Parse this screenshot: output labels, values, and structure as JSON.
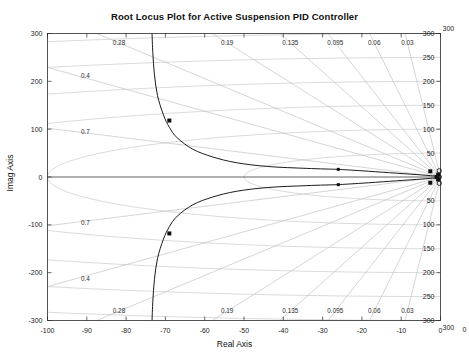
{
  "figure": {
    "title": "Root Locus Plot for Active Suspension PID Controller",
    "xlabel": "Real Axis",
    "ylabel": "Imag Axis",
    "top_artifact": "clipped text row"
  },
  "chart_data": {
    "type": "line",
    "title": "Root Locus Plot for Active Suspension PID Controller",
    "xlabel": "Real Axis",
    "ylabel": "Imag Axis",
    "xlim": [
      -100,
      0
    ],
    "ylim": [
      -300,
      300
    ],
    "grid": true,
    "legend": "none",
    "xticks": [
      -100,
      -90,
      -80,
      -70,
      -60,
      -50,
      -40,
      -30,
      -20,
      -10,
      0
    ],
    "xticklabels": [
      "-100",
      "-90",
      "-80",
      "-70",
      "-60",
      "-50",
      "-40",
      "-30",
      "-20",
      "-10",
      "0"
    ],
    "yticks": [
      -300,
      -200,
      -100,
      0,
      100,
      200,
      300
    ],
    "yticklabels": [
      "-300",
      "-200",
      "-100",
      "0",
      "100",
      "200",
      "300"
    ],
    "damping_labels_top": [
      "0.28",
      "0.19",
      "0.135",
      "0.095",
      "0.06",
      "0.03"
    ],
    "damping_labels_bottom": [
      "0.28",
      "0.19",
      "0.135",
      "0.095",
      "0.06",
      "0.03"
    ],
    "damping_labels_left_upper": [
      "0.4",
      "0.7"
    ],
    "damping_labels_left_lower": [
      "0.7",
      "0.4"
    ],
    "damping_ratios": [
      0.03,
      0.06,
      0.095,
      0.135,
      0.19,
      0.28,
      0.4,
      0.7
    ],
    "freq_labels_upper": [
      "50",
      "100",
      "150",
      "200",
      "250",
      "300"
    ],
    "freq_labels_lower": [
      "50",
      "100",
      "150",
      "200",
      "250",
      "300"
    ],
    "natural_frequencies": [
      50,
      100,
      150,
      200,
      250,
      300
    ],
    "corner_label_top_right": "300",
    "corner_label_bottom_right": "300",
    "corner_label_outer": "0",
    "series": [
      {
        "name": "locus-branch-upper",
        "points": [
          [
            -1.2,
            2
          ],
          [
            -6,
            5
          ],
          [
            -13,
            9
          ],
          [
            -20,
            13
          ],
          [
            -26,
            16
          ]
        ]
      },
      {
        "name": "locus-branch-upper-arc",
        "points": [
          [
            -26,
            16
          ],
          [
            -34,
            18
          ],
          [
            -44,
            22
          ],
          [
            -52,
            30
          ],
          [
            -58,
            42
          ],
          [
            -63,
            58
          ],
          [
            -67,
            82
          ],
          [
            -69,
            104
          ],
          [
            -70.5,
            130
          ],
          [
            -72,
            170
          ],
          [
            -72.8,
            215
          ],
          [
            -73.2,
            260
          ],
          [
            -73.4,
            300
          ]
        ]
      },
      {
        "name": "locus-branch-lower",
        "points": [
          [
            -1.2,
            -2
          ],
          [
            -6,
            -5
          ],
          [
            -13,
            -9
          ],
          [
            -20,
            -13
          ],
          [
            -26,
            -16
          ]
        ]
      },
      {
        "name": "locus-branch-lower-arc",
        "points": [
          [
            -26,
            -16
          ],
          [
            -34,
            -18
          ],
          [
            -44,
            -22
          ],
          [
            -52,
            -30
          ],
          [
            -58,
            -42
          ],
          [
            -63,
            -58
          ],
          [
            -67,
            -82
          ],
          [
            -69,
            -104
          ],
          [
            -70.5,
            -130
          ],
          [
            -72,
            -170
          ],
          [
            -72.8,
            -215
          ],
          [
            -73.2,
            -260
          ],
          [
            -73.4,
            -300
          ]
        ]
      },
      {
        "name": "locus-real-axis-segment",
        "points": [
          [
            -100,
            0
          ],
          [
            0,
            0
          ]
        ]
      }
    ],
    "markers": {
      "poles": [
        [
          -69,
          118
        ],
        [
          -69,
          -118
        ],
        [
          -2.6,
          12
        ],
        [
          -2.6,
          -12
        ],
        [
          -0.6,
          5
        ],
        [
          -0.6,
          -5
        ],
        [
          -1.0,
          0
        ]
      ],
      "zeros": [
        [
          -0.3,
          13
        ],
        [
          -0.3,
          -13
        ],
        [
          -0.3,
          0
        ]
      ],
      "branch_endpoints": [
        [
          -26,
          16
        ],
        [
          -26,
          -16
        ]
      ]
    }
  }
}
